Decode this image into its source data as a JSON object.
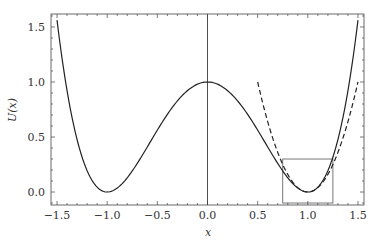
{
  "chart_data": {
    "type": "line",
    "title": "",
    "xlabel": "x",
    "ylabel": "U(x)",
    "xlim": [
      -1.56,
      1.56
    ],
    "ylim": [
      -0.118,
      1.618
    ],
    "grid": false,
    "x_ticks": [
      -1.5,
      -1.0,
      -0.5,
      0.0,
      0.5,
      1.0,
      1.5
    ],
    "x_tick_labels": [
      "−1.5",
      "−1.0",
      "−0.5",
      "0.0",
      "0.5",
      "1.0",
      "1.5"
    ],
    "y_ticks": [
      0.0,
      0.5,
      1.0,
      1.5
    ],
    "y_tick_labels": [
      "0.0",
      "0.5",
      "1.0",
      "1.5"
    ],
    "series": [
      {
        "name": "U(x) = (x^2 - 1)^2",
        "style": "solid",
        "color": "#222222",
        "x_range": [
          -1.5,
          1.5
        ],
        "x": [
          -1.5,
          -1.25,
          -1.0,
          -0.75,
          -0.5,
          -0.25,
          0.0,
          0.25,
          0.5,
          0.75,
          1.0,
          1.25,
          1.5
        ],
        "values": [
          1.5625,
          0.3164,
          0.0,
          0.1914,
          0.5625,
          0.8789,
          1.0,
          0.8789,
          0.5625,
          0.1914,
          0.0,
          0.3164,
          1.5625
        ]
      },
      {
        "name": "harmonic approximation 4(x-1)^2",
        "style": "dashed",
        "color": "#222222",
        "x_range": [
          0.5,
          1.5
        ],
        "x": [
          0.5,
          0.75,
          1.0,
          1.25,
          1.5
        ],
        "values": [
          1.0,
          0.25,
          0.0,
          0.25,
          1.0
        ]
      }
    ],
    "annotations": [
      {
        "type": "vertical-line",
        "x": 0.0,
        "color": "#222222"
      },
      {
        "type": "rectangle",
        "x0": 0.75,
        "x1": 1.25,
        "y0": -0.1,
        "y1": 0.3,
        "color": "#555555"
      }
    ]
  }
}
